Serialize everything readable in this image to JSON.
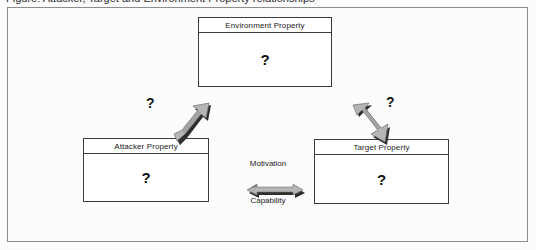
{
  "caption": {
    "cropped_top_line": "Figure: Attacker, Target and Environment Property relationships"
  },
  "diagram": {
    "type": "relationship-diagram",
    "nodes": [
      {
        "id": "environment",
        "title": "Environment Property",
        "body": "?"
      },
      {
        "id": "attacker",
        "title": "Attacker Property",
        "body": "?"
      },
      {
        "id": "target",
        "title": "Target Property",
        "body": "?"
      }
    ],
    "edges": [
      {
        "id": "attacker-environment",
        "from": "Attacker Property",
        "to": "Environment Property",
        "label": "?",
        "arrow": "double-headed-diagonal-up-right",
        "icon": "block-arrow-icon"
      },
      {
        "id": "environment-target",
        "from": "Environment Property",
        "to": "Target Property",
        "label": "?",
        "arrow": "double-headed-diagonal-down-right",
        "icon": "block-arrow-icon"
      },
      {
        "id": "attacker-target",
        "from": "Attacker Property",
        "to": "Target Property",
        "label_above": "Motivation",
        "label_below": "Capability",
        "arrow": "double-headed-horizontal",
        "icon": "block-arrow-icon"
      }
    ]
  },
  "colors": {
    "page_background": "#fcfcfc",
    "frame_border": "#8d8d8d",
    "node_border": "#3a3a3a",
    "node_fill": "#ffffff",
    "text": "#1b1b1b",
    "arrow_fill_light": "#b5b5b5",
    "arrow_fill_mid": "#8f8f8f",
    "arrow_shadow_dark": "#2e2e2e"
  }
}
